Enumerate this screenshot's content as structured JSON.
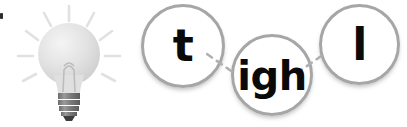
{
  "illustration": {
    "name": "lightbulb",
    "label": "lightbulb",
    "glass_color": "#e2e2e2",
    "base_color": "#777777",
    "ray_color": "#e0e0e0",
    "ray_count": 10
  },
  "diagram": {
    "type": "phoneme-sound-buttons",
    "word": "tigh l",
    "ring_color": "#a6a6a6",
    "text_color": "#0a0a0a",
    "connector_color": "#b0b0b0",
    "connector_style": "dashed",
    "nodes": [
      {
        "id": "t",
        "label": "t",
        "position": "top-left"
      },
      {
        "id": "igh",
        "label": "igh",
        "position": "bottom-middle"
      },
      {
        "id": "l",
        "label": "l",
        "position": "top-right"
      }
    ],
    "connectors": [
      {
        "from": "t",
        "to": "igh"
      },
      {
        "from": "igh",
        "to": "l"
      }
    ]
  }
}
